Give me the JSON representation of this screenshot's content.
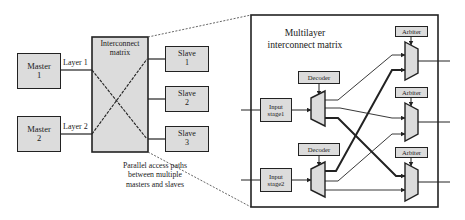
{
  "left_diagram": {
    "masters": [
      {
        "line1": "Master",
        "line2": "1"
      },
      {
        "line1": "Master",
        "line2": "2"
      }
    ],
    "layers": [
      "Layer 1",
      "Layer 2"
    ],
    "matrix": {
      "line1": "Interconnect",
      "line2": "matrix"
    },
    "slaves": [
      {
        "line1": "Slave",
        "line2": "1"
      },
      {
        "line1": "Slave",
        "line2": "2"
      },
      {
        "line1": "Slave",
        "line2": "3"
      }
    ],
    "caption": {
      "line1": "Parallel access paths",
      "line2": "between multiple",
      "line3": "masters and slaves"
    }
  },
  "right_diagram": {
    "title": {
      "line1": "Multilayer",
      "line2": "interconnect matrix"
    },
    "input_stages": [
      {
        "line1": "Input",
        "line2": "stage1"
      },
      {
        "line1": "Input",
        "line2": "stage2"
      }
    ],
    "decoders": [
      "Decoder",
      "Decoder"
    ],
    "arbiters": [
      "Arbiter",
      "Arbiter",
      "Arbiter"
    ]
  },
  "colors": {
    "block_fill": "#dcdcdc",
    "stroke": "#222222",
    "background": "#ffffff"
  }
}
